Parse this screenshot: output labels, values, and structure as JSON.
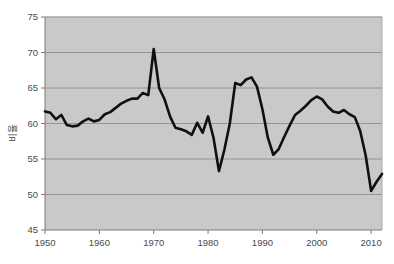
{
  "chart_data": {
    "type": "line",
    "title": "",
    "subtitle": "",
    "xlabel": "",
    "ylabel": "비율",
    "xlim": [
      1950,
      2012
    ],
    "ylim": [
      45,
      75
    ],
    "yticks": [
      45,
      50,
      55,
      60,
      65,
      70,
      75
    ],
    "xticks": [
      1950,
      1960,
      1970,
      1980,
      1990,
      2000,
      2010
    ],
    "ytick_labels": [
      "45",
      "50",
      "55",
      "60",
      "65",
      "70",
      "75"
    ],
    "xtick_labels": [
      "1950",
      "1960",
      "1970",
      "1980",
      "1990",
      "2000",
      "2010"
    ],
    "grid": "horizontal",
    "legend": "none",
    "plot_bgcolor": "#c9c9c9",
    "grid_color": "#8f8f8f",
    "line_color": "#101010",
    "line_width": 2.6,
    "series": [
      {
        "name": "비율",
        "x": [
          1950,
          1951,
          1952,
          1953,
          1954,
          1955,
          1956,
          1957,
          1958,
          1959,
          1960,
          1961,
          1962,
          1963,
          1964,
          1965,
          1966,
          1967,
          1968,
          1969,
          1970,
          1971,
          1972,
          1973,
          1974,
          1975,
          1976,
          1977,
          1978,
          1979,
          1980,
          1981,
          1982,
          1983,
          1984,
          1985,
          1986,
          1987,
          1988,
          1989,
          1990,
          1991,
          1992,
          1993,
          1994,
          1995,
          1996,
          1997,
          1998,
          1999,
          2000,
          2001,
          2002,
          2003,
          2004,
          2005,
          2006,
          2007,
          2008,
          2009,
          2010,
          2011,
          2012
        ],
        "values": [
          61.7,
          61.5,
          60.6,
          61.2,
          59.8,
          59.6,
          59.7,
          60.3,
          60.7,
          60.3,
          60.5,
          61.3,
          61.6,
          62.2,
          62.8,
          63.2,
          63.5,
          63.5,
          64.3,
          64.0,
          70.5,
          65.0,
          63.4,
          61.0,
          59.4,
          59.2,
          58.9,
          58.4,
          60.1,
          58.7,
          61.0,
          58.0,
          53.3,
          56.3,
          60.0,
          65.7,
          65.4,
          66.2,
          66.5,
          65.2,
          62.0,
          58.0,
          55.6,
          56.4,
          58.1,
          59.7,
          61.2,
          61.8,
          62.5,
          63.3,
          63.8,
          63.4,
          62.4,
          61.7,
          61.5,
          61.9,
          61.3,
          60.9,
          58.9,
          55.5,
          50.5,
          51.8,
          52.9
        ]
      }
    ],
    "annotations": {
      "peak_year": 1970,
      "peak_value": 70.5,
      "trough_year": 2010,
      "trough_value": 50.5
    }
  },
  "axes": {
    "y_axis_title": "비율",
    "y_axis_tick_values": [
      "75",
      "70",
      "65",
      "60",
      "55",
      "50",
      "45"
    ],
    "x_axis_tick_values": [
      "1950",
      "1960",
      "1970",
      "1980",
      "1990",
      "2000",
      "2010"
    ]
  }
}
